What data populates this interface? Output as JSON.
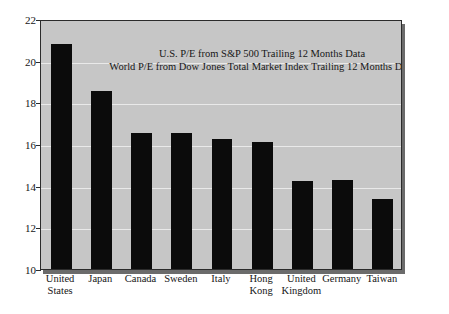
{
  "chart_data": {
    "type": "bar",
    "title": "",
    "subtitle": "",
    "xlabel": "",
    "ylabel": "",
    "ylim": [
      10,
      22
    ],
    "yticks": [
      10,
      12,
      14,
      16,
      18,
      20,
      22
    ],
    "ytick_labels": [
      "10",
      "12",
      "14",
      "16",
      "18",
      "20",
      "22"
    ],
    "grid": true,
    "legend": null,
    "categories": [
      "United States",
      "Japan",
      "Canada",
      "Sweden",
      "Italy",
      "Hong Kong",
      "United Kingdom",
      "Germany",
      "Taiwan"
    ],
    "category_label_lines": [
      [
        "United",
        "States"
      ],
      [
        "Japan"
      ],
      [
        "Canada"
      ],
      [
        "Sweden"
      ],
      [
        "Italy"
      ],
      [
        "Hong",
        "Kong"
      ],
      [
        "United",
        "Kingdom"
      ],
      [
        "Germany"
      ],
      [
        "Taiwan"
      ]
    ],
    "values": [
      20.8,
      18.55,
      16.53,
      16.53,
      16.24,
      16.1,
      14.24,
      14.28,
      13.38
    ],
    "annotations": [
      "U.S. P/E from S&P 500 Trailing 12 Months Data",
      "World P/E from Dow Jones Total Market Index Trailing 12 Months Data"
    ],
    "colors": {
      "bar": "#0b0b0b",
      "plot_background": "#c6c6c6",
      "figure_background": "#ffffff",
      "gridline": "#e9e9e9",
      "axis": "#2b2b2b",
      "text": "#161616"
    }
  }
}
